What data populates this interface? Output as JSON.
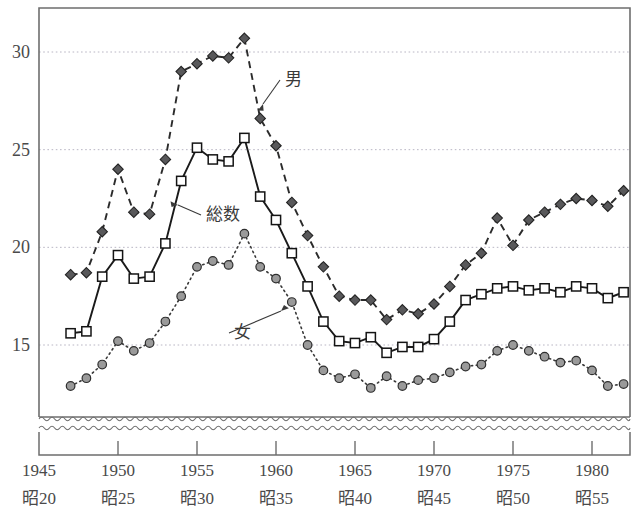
{
  "chart_data": {
    "type": "line",
    "title": "",
    "subtitle": "",
    "xlabel": "",
    "ylabel": "",
    "xlim": [
      1945,
      1983
    ],
    "ylim": [
      12.2,
      31.8
    ],
    "ylim_note": "y-axis broken below ~12.2 (wavy break symbol above the axis)",
    "grid": "horizontal dotted gridlines at 15, 20, 25, 30",
    "legend_position": "inline annotations with leader lines",
    "yticks": [
      15,
      20,
      25,
      30
    ],
    "ytick_labels": [
      "15",
      "20",
      "25",
      "30"
    ],
    "xticks": [
      1945,
      1950,
      1955,
      1960,
      1965,
      1970,
      1975,
      1980
    ],
    "xtick_labels_western": [
      "1945",
      "1950",
      "1955",
      "1960",
      "1965",
      "1970",
      "1975",
      "1980"
    ],
    "xtick_labels_japanese": [
      "昭20",
      "昭25",
      "昭30",
      "昭35",
      "昭40",
      "昭45",
      "昭50",
      "昭55"
    ],
    "x": [
      1947,
      1948,
      1949,
      1950,
      1951,
      1952,
      1953,
      1954,
      1955,
      1956,
      1957,
      1958,
      1959,
      1960,
      1961,
      1962,
      1963,
      1964,
      1965,
      1966,
      1967,
      1968,
      1969,
      1970,
      1971,
      1972,
      1973,
      1974,
      1975,
      1976,
      1977,
      1978,
      1979,
      1980,
      1981,
      1982
    ],
    "series": [
      {
        "name": "男",
        "label": "男",
        "marker": "diamond",
        "marker_fill": "#58585a",
        "linestyle": "dashed",
        "color": "#2b2b2b",
        "values": [
          18.6,
          18.7,
          20.8,
          24.0,
          21.8,
          21.7,
          24.5,
          29.0,
          29.4,
          29.8,
          29.7,
          30.7,
          26.6,
          25.2,
          22.3,
          20.6,
          19.0,
          17.5,
          17.3,
          17.3,
          16.3,
          16.8,
          16.6,
          17.1,
          18.0,
          19.1,
          19.7,
          21.5,
          20.1,
          21.4,
          21.8,
          22.2,
          22.5,
          22.4,
          22.1,
          22.9
        ]
      },
      {
        "name": "総数",
        "label": "総数",
        "marker": "square",
        "marker_fill": "#ffffff",
        "linestyle": "solid",
        "color": "#1a1a1a",
        "values": [
          15.6,
          15.7,
          18.5,
          19.6,
          18.4,
          18.5,
          20.2,
          23.4,
          25.1,
          24.5,
          24.4,
          25.6,
          22.6,
          21.4,
          19.7,
          18.0,
          16.2,
          15.2,
          15.1,
          15.4,
          14.6,
          14.9,
          14.9,
          15.3,
          16.2,
          17.3,
          17.6,
          17.9,
          18.0,
          17.8,
          17.9,
          17.7,
          18.0,
          17.9,
          17.4,
          17.7
        ]
      },
      {
        "name": "女",
        "label": "女",
        "marker": "circle",
        "marker_fill": "#9a9a9a",
        "linestyle": "dotted",
        "color": "#3a3a3a",
        "values": [
          12.9,
          13.3,
          14.0,
          15.2,
          14.7,
          15.1,
          16.2,
          17.5,
          19.0,
          19.3,
          19.1,
          20.7,
          19.0,
          18.4,
          17.2,
          15.0,
          13.7,
          13.3,
          13.5,
          12.8,
          13.4,
          12.9,
          13.2,
          13.3,
          13.6,
          13.9,
          14.0,
          14.7,
          15.0,
          14.7,
          14.4,
          14.1,
          14.2,
          13.7,
          12.9,
          13.0
        ]
      }
    ],
    "annotations": [
      {
        "text": "男",
        "kind": "series-callout"
      },
      {
        "text": "総数",
        "kind": "series-callout"
      },
      {
        "text": "女",
        "kind": "series-callout"
      }
    ]
  },
  "axis": {
    "y_labels": [
      "30",
      "25",
      "20",
      "15"
    ],
    "x_labels": [
      {
        "western": "1945",
        "japanese": "昭20"
      },
      {
        "western": "1950",
        "japanese": "昭25"
      },
      {
        "western": "1955",
        "japanese": "昭30"
      },
      {
        "western": "1960",
        "japanese": "昭35"
      },
      {
        "western": "1965",
        "japanese": "昭40"
      },
      {
        "western": "1970",
        "japanese": "昭45"
      },
      {
        "western": "1975",
        "japanese": "昭50"
      },
      {
        "western": "1980",
        "japanese": "昭55"
      }
    ]
  },
  "labels": {
    "male": "男",
    "total": "総数",
    "female": "女"
  },
  "colors": {
    "frame": "#6e6e6e",
    "grid": "#b9b6c4",
    "male": "#2b2b2b",
    "male_fill": "#58585a",
    "total": "#1a1a1a",
    "total_fill": "#ffffff",
    "female": "#3a3a3a",
    "female_fill": "#9a9a9a",
    "text": "#4a4a4a"
  }
}
